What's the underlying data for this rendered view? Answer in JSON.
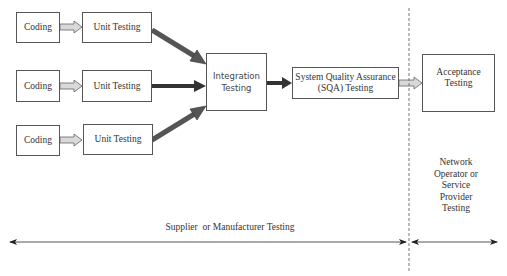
{
  "diagram": {
    "rows": [
      {
        "coding": "Coding",
        "unit_testing": "Unit Testing"
      },
      {
        "coding": "Coding",
        "unit_testing": "Unit Testing"
      },
      {
        "coding": "Coding",
        "unit_testing": "Unit Testing"
      }
    ],
    "integration": {
      "line1": "Integration",
      "line2": "Testing"
    },
    "sqa": {
      "line1": "System Quality Assurance",
      "line2": "(SQA) Testing"
    },
    "acceptance": {
      "line1": "Acceptance",
      "line2": "Testing"
    },
    "network_label": {
      "line1": "Network",
      "line2": "Operator or",
      "line3": "Service",
      "line4": "Provider",
      "line5": "Testing"
    },
    "supplier_label": "Supplier  or Manufacturer Testing",
    "colors": {
      "box_border": "#555555",
      "dark_arrow": "#555555",
      "light_arrow": "#d9d9d9",
      "text": "#333333"
    }
  }
}
